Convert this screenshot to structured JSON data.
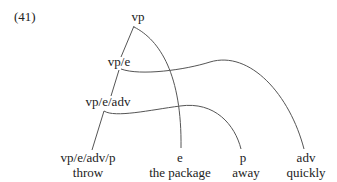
{
  "example_number": "(41)",
  "nodes": {
    "root": "vp",
    "level1": "vp/e",
    "level2": "vp/e/adv",
    "level3": "vp/e/adv/p"
  },
  "leaves": [
    {
      "category": "vp/e/adv/p",
      "word": "throw"
    },
    {
      "category": "e",
      "word": "the package"
    },
    {
      "category": "p",
      "word": "away"
    },
    {
      "category": "adv",
      "word": "quickly"
    }
  ],
  "edges": [
    {
      "from": "vp",
      "to": "vp/e",
      "type": "straight"
    },
    {
      "from": "vp",
      "to": "e",
      "type": "curve"
    },
    {
      "from": "vp/e",
      "to": "vp/e/adv",
      "type": "straight"
    },
    {
      "from": "vp/e",
      "to": "adv",
      "type": "curve"
    },
    {
      "from": "vp/e/adv",
      "to": "vp/e/adv/p",
      "type": "straight"
    },
    {
      "from": "vp/e/adv",
      "to": "p",
      "type": "curve"
    }
  ]
}
